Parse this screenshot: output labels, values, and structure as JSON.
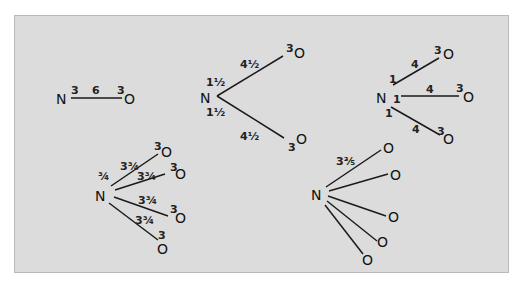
{
  "figure": {
    "background_color": "#dcdcdc",
    "border_color": "#b9b9b9",
    "ink_color": "#1a1a1a"
  },
  "diagrams": [
    {
      "id": "single-bond",
      "center": "N",
      "n_valence_label": "3",
      "bonds": [
        {
          "bond_label": "6",
          "o_label": "3",
          "atom": "O"
        }
      ]
    },
    {
      "id": "two-bonds",
      "center": "N",
      "bonds": [
        {
          "n_label": "1½",
          "bond_label": "4½",
          "o_label": "3",
          "atom": "O"
        },
        {
          "n_label": "1½",
          "bond_label": "4½",
          "o_label": "3",
          "atom": "O"
        }
      ]
    },
    {
      "id": "three-bonds",
      "center": "N",
      "bonds": [
        {
          "n_label": "1",
          "bond_label": "4",
          "o_label": "3",
          "atom": "O"
        },
        {
          "n_label": "1",
          "bond_label": "4",
          "o_label": "3",
          "atom": "O"
        },
        {
          "n_label": "1",
          "bond_label": "4",
          "o_label": "3",
          "atom": "O"
        }
      ]
    },
    {
      "id": "four-bonds",
      "center": "N",
      "n_label": "¾",
      "bonds": [
        {
          "bond_label": "3¾",
          "o_label": "3",
          "atom": "O"
        },
        {
          "bond_label": "3¾",
          "o_label": "3",
          "atom": "O"
        },
        {
          "bond_label": "3¾",
          "o_label": "3",
          "atom": "O"
        },
        {
          "bond_label": "3¾",
          "o_label": "3",
          "atom": "O"
        }
      ]
    },
    {
      "id": "five-bonds",
      "center": "N",
      "bond_label": "3⅗",
      "bonds": [
        {
          "atom": "O"
        },
        {
          "atom": "O"
        },
        {
          "atom": "O"
        },
        {
          "atom": "O"
        },
        {
          "atom": "O"
        }
      ]
    }
  ]
}
